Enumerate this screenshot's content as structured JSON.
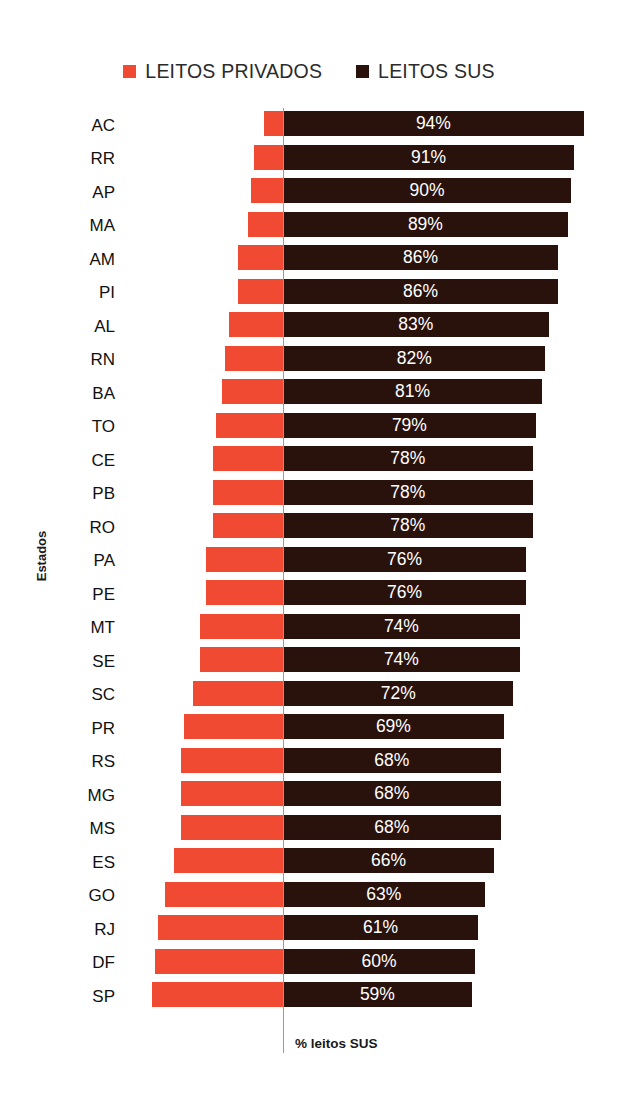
{
  "chart_data": {
    "type": "bar",
    "subtype": "diverging-stacked-horizontal",
    "title": "",
    "xlabel": "% leitos SUS",
    "ylabel": "Estados",
    "grid": false,
    "legend_position": "top-center",
    "axis_origin_percent": 0,
    "scale_px_per_percent": 3.2,
    "categories": [
      "AC",
      "RR",
      "AP",
      "MA",
      "AM",
      "PI",
      "AL",
      "RN",
      "BA",
      "TO",
      "CE",
      "PB",
      "RO",
      "PA",
      "PE",
      "MT",
      "SE",
      "SC",
      "PR",
      "RS",
      "MG",
      "MS",
      "ES",
      "GO",
      "RJ",
      "DF",
      "SP"
    ],
    "series": [
      {
        "name": "LEITOS PRIVADOS",
        "color": "#F04A32",
        "direction": "left",
        "values": [
          6,
          9,
          10,
          11,
          14,
          14,
          17,
          18,
          19,
          21,
          22,
          22,
          22,
          24,
          24,
          26,
          26,
          28,
          31,
          32,
          32,
          32,
          34,
          37,
          39,
          40,
          41
        ]
      },
      {
        "name": "LEITOS SUS",
        "color": "#2A120C",
        "direction": "right",
        "values": [
          94,
          91,
          90,
          89,
          86,
          86,
          83,
          82,
          81,
          79,
          78,
          78,
          78,
          76,
          76,
          74,
          74,
          72,
          69,
          68,
          68,
          68,
          66,
          63,
          61,
          60,
          59
        ]
      }
    ],
    "data_labels": [
      "94%",
      "91%",
      "90%",
      "89%",
      "86%",
      "86%",
      "83%",
      "82%",
      "81%",
      "79%",
      "78%",
      "78%",
      "78%",
      "76%",
      "76%",
      "74%",
      "74%",
      "72%",
      "69%",
      "68%",
      "68%",
      "68%",
      "66%",
      "63%",
      "61%",
      "60%",
      "59%"
    ]
  },
  "legend": {
    "entries": [
      {
        "label": "LEITOS PRIVADOS",
        "color": "#F04A32",
        "swatch_icon": "square-swatch-icon"
      },
      {
        "label": "LEITOS SUS",
        "color": "#2A120C",
        "swatch_icon": "square-swatch-icon"
      }
    ]
  },
  "axes": {
    "y_title": "Estados",
    "x_title": "% leitos SUS"
  }
}
